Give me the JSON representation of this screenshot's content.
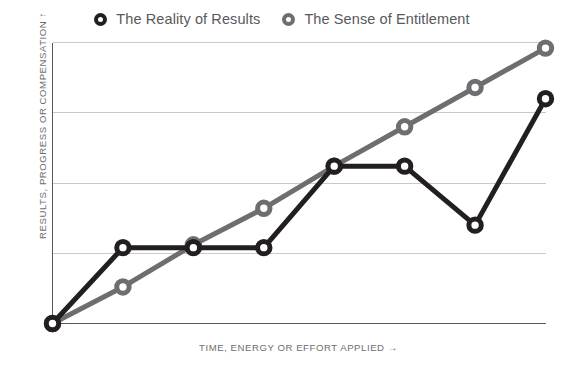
{
  "legend": {
    "position": "top-center",
    "entries": [
      {
        "label": "The Reality of Results",
        "marker": "dark-ring-icon",
        "color": "#231f20"
      },
      {
        "label": "The Sense of Entitlement",
        "marker": "gray-ring-icon",
        "color": "#6d6e70"
      }
    ]
  },
  "axes": {
    "y_title": "RESULTS, PROGRESS OR COMPENSATION  ↑",
    "x_title": "TIME, ENERGY OR EFFORT APPLIED  →"
  },
  "colors": {
    "reality_line": "#231f20",
    "entitlement_line": "#6d6e70",
    "gridline": "#c9c9c9",
    "axis": "#58595b",
    "background": "#ffffff",
    "text": "#58595b"
  },
  "chart_data": {
    "type": "line",
    "title": "",
    "subtitle": "",
    "xlabel": "TIME, ENERGY OR EFFORT APPLIED →",
    "ylabel": "RESULTS, PROGRESS OR COMPENSATION ↑",
    "xlim": [
      0,
      7
    ],
    "ylim": [
      0,
      1
    ],
    "grid": true,
    "grid_axis": "y",
    "gridlines_y": [
      0.25,
      0.5,
      0.75,
      1.0
    ],
    "x_ticks_shown": false,
    "y_ticks_shown": false,
    "x": [
      0,
      1,
      2,
      3,
      4,
      5,
      6,
      7
    ],
    "series": [
      {
        "name": "The Reality of Results",
        "color": "#231f20",
        "marker": "open-circle",
        "values": [
          0.0,
          0.27,
          0.27,
          0.27,
          0.56,
          0.56,
          0.35,
          0.8
        ]
      },
      {
        "name": "The Sense of Entitlement",
        "color": "#6d6e70",
        "marker": "open-circle",
        "values": [
          0.0,
          0.13,
          0.28,
          0.41,
          0.56,
          0.7,
          0.84,
          0.98
        ]
      }
    ],
    "annotations": []
  }
}
